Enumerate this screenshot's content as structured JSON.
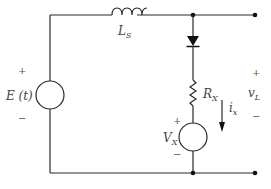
{
  "diagram": {
    "type": "circuit",
    "components": {
      "source_e": {
        "label": "E (t)",
        "plus": "+",
        "minus": "−"
      },
      "inductor": {
        "label": "L",
        "sub": "S"
      },
      "diode": {
        "label": ""
      },
      "resistor": {
        "label": "R",
        "sub": "X"
      },
      "source_vx": {
        "label": "V",
        "sub": "X",
        "plus": "+",
        "minus": "−"
      },
      "current": {
        "label": "i",
        "sub": "x"
      },
      "output": {
        "label": "v",
        "sub": "L",
        "plus": "+",
        "minus": "−"
      }
    },
    "colors": {
      "wire": "#2a2a2a",
      "text": "#444444"
    }
  }
}
